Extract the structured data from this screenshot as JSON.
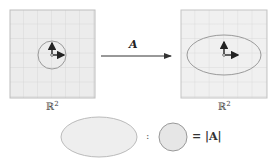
{
  "left_panel": {
    "space_label": "ℝ",
    "space_exponent": "2",
    "shape": "unit circle"
  },
  "right_panel": {
    "space_label": "ℝ",
    "space_exponent": "2",
    "shape": "ellipse"
  },
  "transform": {
    "label": "A"
  },
  "ratio": {
    "colon": ":",
    "result": "= |A|"
  },
  "colors": {
    "grid_fill": "#ececec",
    "grid_line": "#d0d0d0",
    "shape_stroke": "#9a9a9a",
    "arrow": "#222222"
  }
}
